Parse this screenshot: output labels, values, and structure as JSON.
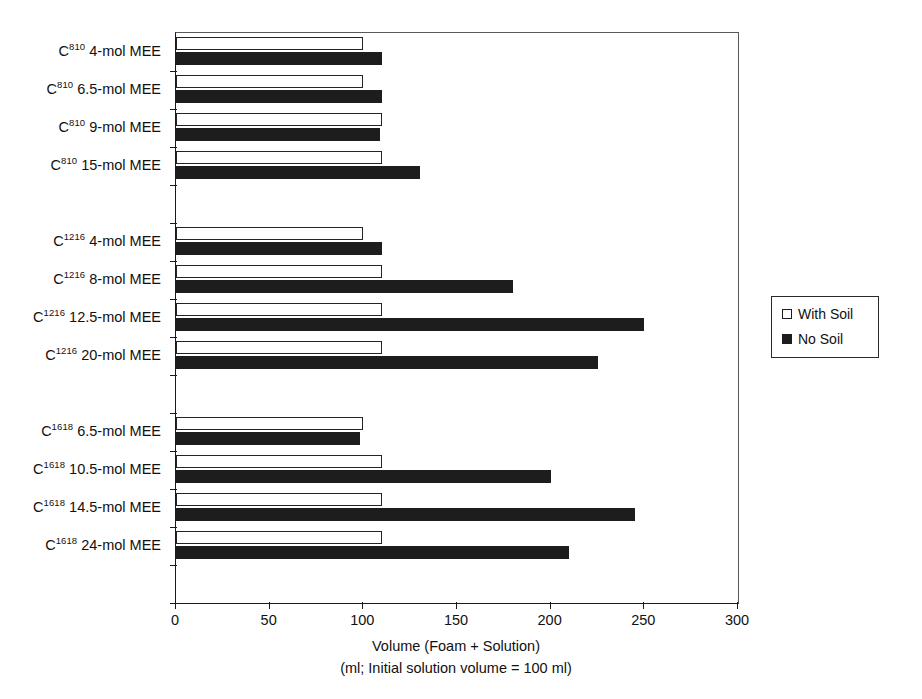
{
  "chart_data": {
    "type": "bar",
    "orientation": "horizontal",
    "title": "",
    "xlabel_line1": "Volume (Foam + Solution)",
    "xlabel_line2": "(ml; Initial solution volume = 100 ml)",
    "ylabel": "",
    "xlim": [
      0,
      300
    ],
    "xticks": [
      0,
      50,
      100,
      150,
      200,
      250,
      300
    ],
    "xticklabels": [
      "0",
      "50",
      "100",
      "150",
      "200",
      "250",
      "300"
    ],
    "grid": false,
    "legend_position": "right",
    "series": [
      {
        "name": "With Soil",
        "fill": "#ffffff",
        "edge": "#232323",
        "values": [
          100,
          100,
          110,
          110,
          100,
          110,
          110,
          110,
          100,
          110,
          110,
          110
        ]
      },
      {
        "name": "No Soil",
        "fill": "#1d1d1d",
        "edge": "#1d1d1d",
        "values": [
          110,
          110,
          109,
          130,
          110,
          180,
          250,
          225,
          98,
          200,
          245,
          210
        ]
      }
    ],
    "categories": [
      {
        "prefix": "C",
        "sup": "810",
        "suffix": " 4-mol MEE",
        "group": 0
      },
      {
        "prefix": "C",
        "sup": "810",
        "suffix": " 6.5-mol MEE",
        "group": 0
      },
      {
        "prefix": "C",
        "sup": "810",
        "suffix": " 9-mol MEE",
        "group": 0
      },
      {
        "prefix": "C",
        "sup": "810",
        "suffix": " 15-mol MEE",
        "group": 0
      },
      {
        "prefix": "C",
        "sup": "1216",
        "suffix": " 4-mol MEE",
        "group": 1
      },
      {
        "prefix": "C",
        "sup": "1216",
        "suffix": " 8-mol MEE",
        "group": 1
      },
      {
        "prefix": "C",
        "sup": "1216",
        "suffix": " 12.5-mol MEE",
        "group": 1
      },
      {
        "prefix": "C",
        "sup": "1216",
        "suffix": " 20-mol MEE",
        "group": 1
      },
      {
        "prefix": "C",
        "sup": "1618",
        "suffix": " 6.5-mol MEE",
        "group": 2
      },
      {
        "prefix": "C",
        "sup": "1618",
        "suffix": " 10.5-mol MEE",
        "group": 2
      },
      {
        "prefix": "C",
        "sup": "1618",
        "suffix": " 14.5-mol MEE",
        "group": 2
      },
      {
        "prefix": "C",
        "sup": "1618",
        "suffix": " 24-mol MEE",
        "group": 2
      }
    ],
    "legend": [
      {
        "label": "With Soil",
        "swatch": "open"
      },
      {
        "label": "No Soil",
        "swatch": "solid"
      }
    ]
  }
}
